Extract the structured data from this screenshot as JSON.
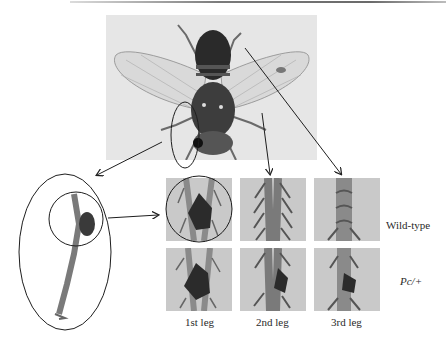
{
  "figure": {
    "main_photo": {
      "subject": "fly dorsal view",
      "icon": "fly-photo"
    },
    "row_labels": [
      {
        "text": "Wild-type",
        "style": "normal"
      },
      {
        "text": "Pc/+",
        "style": "italic"
      }
    ],
    "column_labels": [
      "1st leg",
      "2nd leg",
      "3rd leg"
    ],
    "panels": [
      {
        "row": "Wild-type",
        "column": "1st leg",
        "comb": "large",
        "circled": true
      },
      {
        "row": "Wild-type",
        "column": "2nd leg",
        "comb": "none",
        "circled": false
      },
      {
        "row": "Wild-type",
        "column": "3rd leg",
        "comb": "none",
        "circled": false
      },
      {
        "row": "Pc/+",
        "column": "1st leg",
        "comb": "large",
        "circled": false
      },
      {
        "row": "Pc/+",
        "column": "2nd leg",
        "comb": "ectopic",
        "circled": false
      },
      {
        "row": "Pc/+",
        "column": "3rd leg",
        "comb": "ectopic",
        "circled": false
      }
    ],
    "colors": {
      "background": "#ffffff",
      "photo_bg": "#e6e6e6",
      "panel_bg": "#c9c9c9",
      "ink": "#1e1e1e",
      "comb": "#2b2b2b"
    }
  }
}
